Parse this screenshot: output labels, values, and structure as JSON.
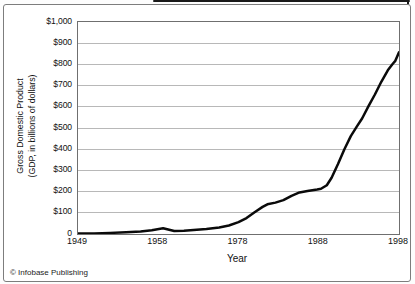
{
  "figure": {
    "footer": "© Infobase Publishing"
  },
  "chart_data": {
    "type": "line",
    "xlabel": "Year",
    "ylabel_lines": [
      "Gross Domestic Product",
      "(GDP, in billions of dollars)"
    ],
    "x_tick_labels": [
      "1949",
      "1958",
      "1978",
      "1988",
      "1998"
    ],
    "x_ticks_evenly_spaced": true,
    "y_tick_labels": [
      "$1,000",
      "$900",
      "$800",
      "$700",
      "$600",
      "$500",
      "$400",
      "$300",
      "$200",
      "$100",
      "0"
    ],
    "ylim": [
      0,
      1000
    ],
    "grid": "horizontal-only",
    "legend": "none",
    "colors": {
      "line": "#0a0a0a",
      "grid": "#b8b8b8",
      "plot_border": "#6f6f6f",
      "frame_border": "#7d7d7d",
      "text": "#111111"
    },
    "approx_values_at_x_ticks": [
      3,
      20,
      56,
      213,
      857
    ],
    "series": [
      {
        "name": "GDP (billions of dollars)",
        "points_axisfrac_value": [
          [
            0.0,
            3
          ],
          [
            0.05,
            3
          ],
          [
            0.1,
            5
          ],
          [
            0.15,
            8
          ],
          [
            0.195,
            12
          ],
          [
            0.23,
            18
          ],
          [
            0.265,
            27
          ],
          [
            0.3,
            14
          ],
          [
            0.33,
            15
          ],
          [
            0.36,
            19
          ],
          [
            0.4,
            23
          ],
          [
            0.44,
            31
          ],
          [
            0.47,
            40
          ],
          [
            0.5,
            56
          ],
          [
            0.525,
            75
          ],
          [
            0.55,
            103
          ],
          [
            0.575,
            128
          ],
          [
            0.59,
            140
          ],
          [
            0.615,
            148
          ],
          [
            0.64,
            160
          ],
          [
            0.665,
            180
          ],
          [
            0.69,
            196
          ],
          [
            0.715,
            203
          ],
          [
            0.745,
            210
          ],
          [
            0.757,
            213
          ],
          [
            0.775,
            230
          ],
          [
            0.79,
            265
          ],
          [
            0.81,
            330
          ],
          [
            0.83,
            400
          ],
          [
            0.85,
            462
          ],
          [
            0.868,
            505
          ],
          [
            0.885,
            545
          ],
          [
            0.905,
            603
          ],
          [
            0.925,
            658
          ],
          [
            0.945,
            718
          ],
          [
            0.965,
            772
          ],
          [
            0.98,
            802
          ],
          [
            0.988,
            815
          ],
          [
            1.0,
            857
          ]
        ]
      }
    ]
  }
}
